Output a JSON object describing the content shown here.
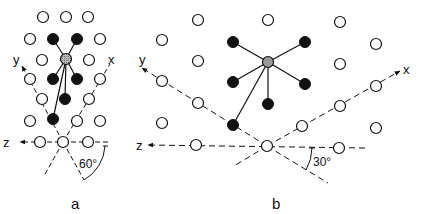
{
  "panels": [
    {
      "id": "a",
      "caption": "a",
      "angle_label": "60°",
      "axis_labels": {
        "x": "x",
        "y": "y",
        "z": "z"
      },
      "center": [
        63,
        142
      ],
      "central_atom": [
        66,
        59
      ],
      "open_atoms": [
        [
          43,
          17
        ],
        [
          66,
          17
        ],
        [
          88,
          17
        ],
        [
          30,
          39
        ],
        [
          100,
          39
        ],
        [
          42,
          60
        ],
        [
          89,
          60
        ],
        [
          30,
          79
        ],
        [
          100,
          79
        ],
        [
          42,
          99
        ],
        [
          89,
          99
        ],
        [
          30,
          121
        ],
        [
          77,
          121
        ],
        [
          100,
          121
        ],
        [
          40,
          142
        ],
        [
          63,
          142
        ],
        [
          88,
          142
        ]
      ],
      "filled_atoms": [
        [
          53,
          39
        ],
        [
          77,
          39
        ],
        [
          53,
          79
        ],
        [
          77,
          79
        ],
        [
          65,
          99
        ],
        [
          53,
          119
        ]
      ]
    },
    {
      "id": "b",
      "caption": "b",
      "angle_label": "30°",
      "axis_labels": {
        "x": "x",
        "y": "y",
        "z": "z"
      },
      "center": [
        267,
        146
      ],
      "central_atom": [
        268,
        62
      ],
      "open_atoms": [
        [
          198,
          20
        ],
        [
          268,
          20
        ],
        [
          340,
          22
        ],
        [
          162,
          40
        ],
        [
          376,
          44
        ],
        [
          198,
          61
        ],
        [
          340,
          64
        ],
        [
          162,
          81
        ],
        [
          376,
          86
        ],
        [
          198,
          103
        ],
        [
          340,
          106
        ],
        [
          162,
          123
        ],
        [
          302,
          126
        ],
        [
          376,
          128
        ],
        [
          196,
          145
        ],
        [
          267,
          146
        ],
        [
          339,
          148
        ]
      ],
      "filled_atoms": [
        [
          233,
          42
        ],
        [
          305,
          42
        ],
        [
          233,
          82
        ],
        [
          305,
          84
        ],
        [
          268,
          104
        ],
        [
          233,
          125
        ]
      ]
    }
  ],
  "colors": {
    "stroke": "#111111",
    "filled": "#111111",
    "central": "#9a9a9a",
    "open": "#ffffff"
  }
}
